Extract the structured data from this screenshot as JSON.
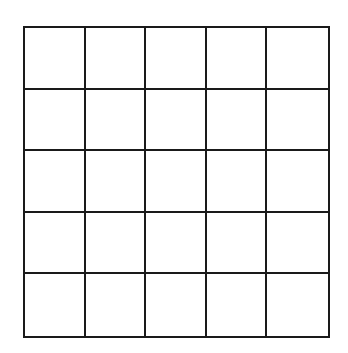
{
  "diagram": {
    "type": "grid",
    "rows": 5,
    "columns": 5,
    "line_color": "#1a1a1a",
    "background_color": "#ffffff",
    "cells": [
      [
        "",
        "",
        "",
        "",
        ""
      ],
      [
        "",
        "",
        "",
        "",
        ""
      ],
      [
        "",
        "",
        "",
        "",
        ""
      ],
      [
        "",
        "",
        "",
        "",
        ""
      ],
      [
        "",
        "",
        "",
        "",
        ""
      ]
    ]
  }
}
